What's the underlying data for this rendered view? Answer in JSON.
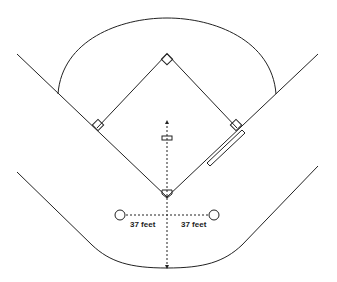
{
  "diagram": {
    "labels": {
      "left_distance": "37 feet",
      "right_distance": "37 feet"
    },
    "elements": [
      "outfield-arc",
      "foul-lines",
      "infield-diamond",
      "bases",
      "pitching-rubber",
      "home-plate",
      "runner-lane",
      "backstop",
      "on-deck-circles"
    ],
    "colors": {
      "line": "#222222",
      "background": "#ffffff"
    }
  }
}
